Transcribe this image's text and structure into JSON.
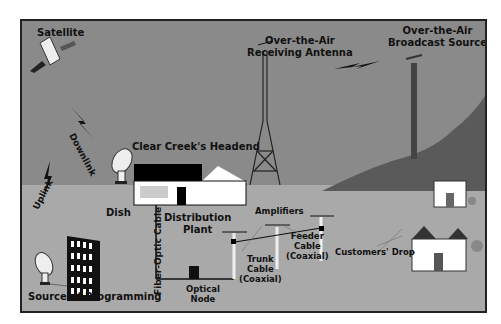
{
  "diagram": {
    "labels": {
      "satellite": "Satellite",
      "downlink": "Downlink",
      "uplink": "Uplink",
      "ota_antenna_line1": "Over-the-Air",
      "ota_antenna_line2": "Receiving Antenna",
      "ota_source_line1": "Over-the-Air",
      "ota_source_line2": "Broadcast Source",
      "headend": "Clear Creek's Headend",
      "dish": "Dish",
      "fiber": "Fiber-Optic Cable",
      "distribution_line1": "Distribution",
      "distribution_line2": "Plant",
      "amplifiers": "Amplifiers",
      "optical_line1": "Optical",
      "optical_line2": "Node",
      "trunk_line1": "Trunk",
      "trunk_line2": "Cable",
      "trunk_line3": "(Coaxial)",
      "feeder_line1": "Feeder",
      "feeder_line2": "Cable",
      "feeder_line3": "(Coaxial)",
      "customers_drop": "Customers' Drop",
      "source": "Source of Programming"
    },
    "colors": {
      "sky": "#8a8a8a",
      "ground": "#a9a9a9",
      "hill": "#5a5a5a",
      "border": "#222222"
    }
  }
}
